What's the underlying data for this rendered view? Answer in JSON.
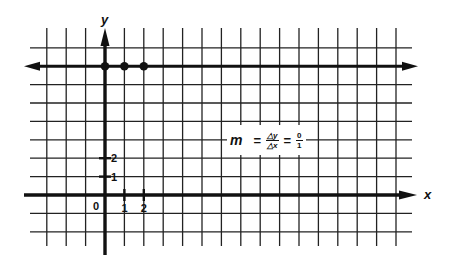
{
  "chart_data": {
    "type": "scatter",
    "title": "",
    "xlabel": "x",
    "ylabel": "y",
    "xlim": [
      -3,
      15
    ],
    "ylim": [
      -3,
      7
    ],
    "grid": true,
    "x_tick_labels": [
      "0",
      "1",
      "2"
    ],
    "y_tick_labels": [
      "1",
      "2"
    ],
    "series": [
      {
        "name": "points",
        "x": [
          0,
          1,
          2
        ],
        "y": [
          7,
          7,
          7
        ]
      }
    ],
    "lines": [
      {
        "name": "horizontal line y=7",
        "equation": "y = 7",
        "slope": 0,
        "arrows": "both"
      }
    ],
    "annotations": [
      {
        "text": "m = Δy/Δx = 0/1",
        "slope_numerator": "0",
        "slope_denominator": "1"
      }
    ]
  },
  "axes": {
    "x_label": "x",
    "y_label": "y",
    "origin_label": "0",
    "x_ticks": [
      "1",
      "2"
    ],
    "y_ticks": [
      "1",
      "2"
    ]
  },
  "formula": {
    "m": "m",
    "equals": "=",
    "delta_y": "△y",
    "delta_x": "△x",
    "equals2": "=",
    "numerator": "0",
    "denominator": "1"
  },
  "colors": {
    "ink": "#111111",
    "grid": "#222222",
    "background": "#ffffff"
  }
}
